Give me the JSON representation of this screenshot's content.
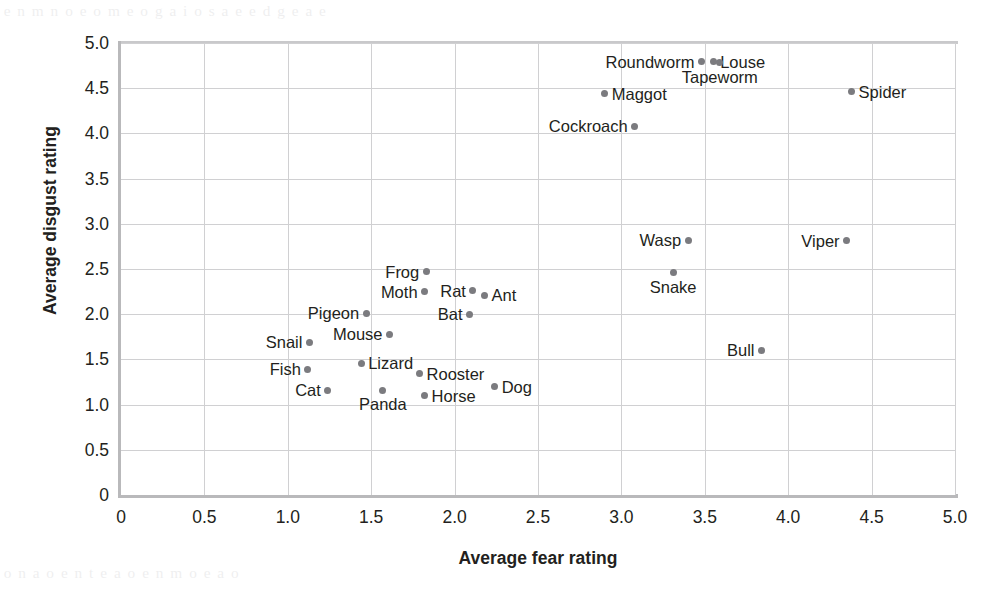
{
  "chart_data": {
    "type": "scatter",
    "title": "",
    "xlabel": "Average fear rating",
    "ylabel": "Average disgust rating",
    "xlim": [
      0,
      5
    ],
    "ylim": [
      0,
      5
    ],
    "xticks": [
      "0",
      "0.5",
      "1.0",
      "1.5",
      "2.0",
      "2.5",
      "3.0",
      "3.5",
      "4.0",
      "4.5",
      "5.0"
    ],
    "yticks": [
      "0",
      "0.5",
      "1.0",
      "1.5",
      "2.0",
      "2.5",
      "3.0",
      "3.5",
      "4.0",
      "4.5",
      "5.0"
    ],
    "grid": true,
    "legend": "none",
    "marker_color": "#7b7b7f",
    "points": [
      {
        "label": "Roundworm",
        "x": 3.48,
        "y": 4.79,
        "label_pos": "left"
      },
      {
        "label": "Louse",
        "x": 3.55,
        "y": 4.79,
        "label_pos": "right"
      },
      {
        "label": "Tapeworm",
        "x": 3.59,
        "y": 4.78,
        "label_pos": "below"
      },
      {
        "label": "Maggot",
        "x": 2.9,
        "y": 4.44,
        "label_pos": "right"
      },
      {
        "label": "Spider",
        "x": 4.38,
        "y": 4.46,
        "label_pos": "right"
      },
      {
        "label": "Cockroach",
        "x": 3.08,
        "y": 4.08,
        "label_pos": "left"
      },
      {
        "label": "Wasp",
        "x": 3.4,
        "y": 2.82,
        "label_pos": "left"
      },
      {
        "label": "Viper",
        "x": 4.35,
        "y": 2.81,
        "label_pos": "left"
      },
      {
        "label": "Snake",
        "x": 3.31,
        "y": 2.46,
        "label_pos": "below"
      },
      {
        "label": "Bull",
        "x": 3.84,
        "y": 1.6,
        "label_pos": "left"
      },
      {
        "label": "Frog",
        "x": 1.83,
        "y": 2.47,
        "label_pos": "left"
      },
      {
        "label": "Moth",
        "x": 1.82,
        "y": 2.25,
        "label_pos": "left"
      },
      {
        "label": "Rat",
        "x": 2.11,
        "y": 2.26,
        "label_pos": "left"
      },
      {
        "label": "Ant",
        "x": 2.18,
        "y": 2.21,
        "label_pos": "right"
      },
      {
        "label": "Bat",
        "x": 2.09,
        "y": 2.0,
        "label_pos": "left"
      },
      {
        "label": "Pigeon",
        "x": 1.47,
        "y": 2.01,
        "label_pos": "left"
      },
      {
        "label": "Mouse",
        "x": 1.61,
        "y": 1.78,
        "label_pos": "left"
      },
      {
        "label": "Snail",
        "x": 1.13,
        "y": 1.69,
        "label_pos": "left"
      },
      {
        "label": "Lizard",
        "x": 1.44,
        "y": 1.46,
        "label_pos": "right"
      },
      {
        "label": "Fish",
        "x": 1.12,
        "y": 1.39,
        "label_pos": "left"
      },
      {
        "label": "Rooster",
        "x": 1.79,
        "y": 1.34,
        "label_pos": "right"
      },
      {
        "label": "Dog",
        "x": 2.24,
        "y": 1.2,
        "label_pos": "right"
      },
      {
        "label": "Cat",
        "x": 1.24,
        "y": 1.16,
        "label_pos": "left"
      },
      {
        "label": "Panda",
        "x": 1.57,
        "y": 1.16,
        "label_pos": "below"
      },
      {
        "label": "Horse",
        "x": 1.82,
        "y": 1.1,
        "label_pos": "right"
      }
    ]
  },
  "page": {
    "bleed_top": "a e  n m n o e  o m  e  o g a i  o  s a e  e d  g e  a  e",
    "bleed_bottom": "e o    n  a  o e  n t  e     a  o e  n  m  o e   a  o"
  }
}
